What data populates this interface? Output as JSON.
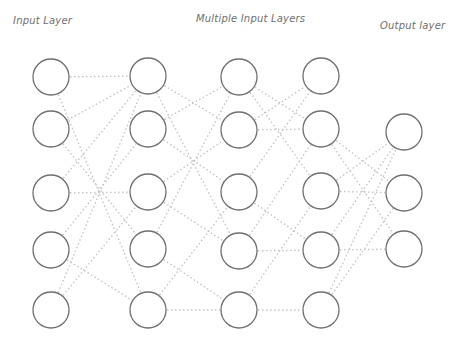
{
  "labels": {
    "input_layer": "Input Layer",
    "hidden_layers": "Multiple Input Layers",
    "output_layer": "Output layer"
  },
  "colors": {
    "node_stroke": "#6f6f6f",
    "edge": "#c4c4c4",
    "text": "#6e6e6e",
    "background": "#ffffff"
  },
  "layers": [
    {
      "name": "input",
      "x": 51,
      "nodes": [
        77,
        129,
        193,
        250,
        310
      ]
    },
    {
      "name": "hidden-1",
      "x": 148,
      "nodes": [
        76,
        129,
        192,
        249,
        310
      ]
    },
    {
      "name": "hidden-2",
      "x": 239,
      "nodes": [
        77,
        130,
        192,
        251,
        310
      ]
    },
    {
      "name": "hidden-3",
      "x": 321,
      "nodes": [
        76,
        129,
        191,
        250,
        310
      ]
    },
    {
      "name": "output",
      "x": 404,
      "nodes": [
        132,
        193,
        249
      ]
    }
  ],
  "node_radius": 18,
  "edges": [
    [
      0,
      0,
      1,
      0
    ],
    [
      0,
      0,
      1,
      4
    ],
    [
      0,
      1,
      1,
      0
    ],
    [
      0,
      1,
      1,
      3
    ],
    [
      0,
      2,
      1,
      0
    ],
    [
      0,
      2,
      1,
      2
    ],
    [
      0,
      3,
      1,
      1
    ],
    [
      0,
      3,
      1,
      4
    ],
    [
      0,
      4,
      1,
      0
    ],
    [
      0,
      4,
      1,
      2
    ],
    [
      1,
      0,
      2,
      1
    ],
    [
      1,
      0,
      2,
      3
    ],
    [
      1,
      1,
      2,
      0
    ],
    [
      1,
      1,
      2,
      2
    ],
    [
      1,
      2,
      2,
      1
    ],
    [
      1,
      2,
      2,
      3
    ],
    [
      1,
      3,
      2,
      0
    ],
    [
      1,
      3,
      2,
      4
    ],
    [
      1,
      4,
      2,
      2
    ],
    [
      1,
      4,
      2,
      4
    ],
    [
      2,
      0,
      3,
      1
    ],
    [
      2,
      0,
      3,
      2
    ],
    [
      2,
      1,
      3,
      0
    ],
    [
      2,
      1,
      3,
      1
    ],
    [
      2,
      2,
      3,
      3
    ],
    [
      2,
      2,
      3,
      0
    ],
    [
      2,
      3,
      3,
      3
    ],
    [
      2,
      3,
      3,
      1
    ],
    [
      2,
      4,
      3,
      2
    ],
    [
      2,
      4,
      3,
      4
    ],
    [
      3,
      1,
      4,
      1
    ],
    [
      3,
      1,
      4,
      2
    ],
    [
      3,
      2,
      4,
      0
    ],
    [
      3,
      2,
      4,
      1
    ],
    [
      3,
      3,
      4,
      0
    ],
    [
      3,
      3,
      4,
      2
    ],
    [
      3,
      4,
      4,
      1
    ],
    [
      3,
      4,
      4,
      0
    ]
  ]
}
